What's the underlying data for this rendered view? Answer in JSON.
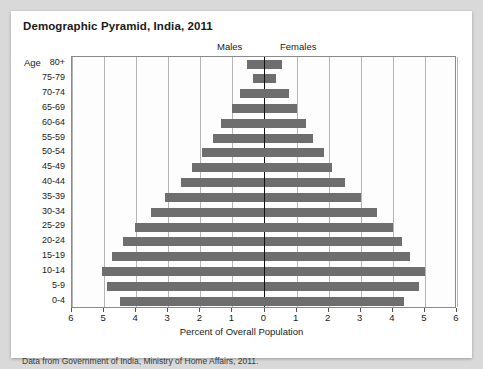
{
  "chart_data": {
    "type": "bar",
    "title": "Demographic Pyramid, India, 2011",
    "xlabel": "Percent of Overall Population",
    "ylabel": "Age",
    "caption": "Data from Government of India, Ministry of Home Affairs, 2011.",
    "orientation": "horizontal",
    "layout": "population-pyramid",
    "grid": true,
    "legend_position": "top",
    "bar_color": "#6e6e6e",
    "axis_color": "#111111",
    "xlim": [
      -6,
      6
    ],
    "xticks": [
      6,
      5,
      4,
      3,
      2,
      1,
      0,
      1,
      2,
      3,
      4,
      5,
      6
    ],
    "categories": [
      "80+",
      "75-79",
      "70-74",
      "65-69",
      "60-64",
      "55-59",
      "50-54",
      "45-49",
      "40-44",
      "35-39",
      "30-34",
      "25-29",
      "20-24",
      "15-19",
      "10-14",
      "5-9",
      "0-4"
    ],
    "series": [
      {
        "name": "Males",
        "values": [
          0.55,
          0.35,
          0.75,
          1.0,
          1.35,
          1.6,
          1.95,
          2.25,
          2.6,
          3.1,
          3.55,
          4.05,
          4.4,
          4.75,
          5.05,
          4.9,
          4.5
        ]
      },
      {
        "name": "Females",
        "values": [
          0.55,
          0.35,
          0.75,
          1.0,
          1.3,
          1.5,
          1.85,
          2.1,
          2.5,
          3.0,
          3.5,
          4.0,
          4.3,
          4.55,
          5.0,
          4.8,
          4.35
        ]
      }
    ]
  }
}
